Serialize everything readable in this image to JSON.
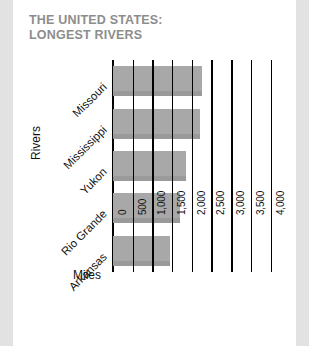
{
  "card": {
    "title_line1": "THE UNITED STATES:",
    "title_line2": "LONGEST RIVERS",
    "title_color": "#8d8d8d",
    "background": "#ffffff",
    "page_background": "#e2e2e2"
  },
  "chart_data": {
    "type": "bar",
    "orientation": "horizontal",
    "title": "THE UNITED STATES: LONGEST RIVERS",
    "categories": [
      "Missouri",
      "Mississippi",
      "Yukon",
      "Rio Grande",
      "Arkansas"
    ],
    "values": [
      2270,
      2200,
      1850,
      1690,
      1450
    ],
    "xlabel": "Miles",
    "ylabel": "Rivers",
    "xlim": [
      0,
      4000
    ],
    "xticks": [
      0,
      500,
      1000,
      1500,
      2000,
      2500,
      3000,
      3500,
      4000
    ],
    "xtick_labels": [
      "0",
      "500",
      "1,000",
      "1,500",
      "2,000",
      "2,500",
      "3,000",
      "3,500",
      "4,000"
    ],
    "grid": true,
    "grid_axis": "x",
    "grid_color": "#000000",
    "bar_color": "#a8a8a8",
    "legend": false
  }
}
